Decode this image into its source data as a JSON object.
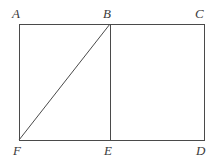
{
  "figure": {
    "type": "geometry-diagram",
    "background_color": "#ffffff",
    "stroke_color": "#4a4a4a",
    "label_color": "#3b3b3b",
    "stroke_width": 1,
    "width": 224,
    "height": 168
  },
  "labels": {
    "a": "A",
    "b": "B",
    "c": "C",
    "d": "D",
    "e": "E",
    "f": "F"
  },
  "points": {
    "A": {
      "x": 19,
      "y": 24
    },
    "B": {
      "x": 110,
      "y": 24
    },
    "C": {
      "x": 204,
      "y": 24
    },
    "D": {
      "x": 204,
      "y": 140
    },
    "E": {
      "x": 110,
      "y": 140
    },
    "F": {
      "x": 19,
      "y": 140
    }
  },
  "label_positions": {
    "A": {
      "left": 12,
      "top": 7
    },
    "B": {
      "left": 103,
      "top": 7
    },
    "C": {
      "left": 195,
      "top": 7
    },
    "D": {
      "left": 196,
      "top": 144
    },
    "E": {
      "left": 104,
      "top": 144
    },
    "F": {
      "left": 13,
      "top": 144
    }
  },
  "segments": [
    {
      "name": "side-AC-top",
      "from": "A",
      "to": "C"
    },
    {
      "name": "side-CD-right",
      "from": "C",
      "to": "D"
    },
    {
      "name": "side-FD-bottom",
      "from": "F",
      "to": "D"
    },
    {
      "name": "side-AF-left",
      "from": "A",
      "to": "F"
    },
    {
      "name": "segment-BE-vertical",
      "from": "B",
      "to": "E"
    },
    {
      "name": "segment-FB-diagonal",
      "from": "F",
      "to": "B"
    }
  ],
  "paths": {
    "rectangle_ACDF": "M 19 24 L 204 24 L 204 140 L 19 140 Z",
    "segment_BE": "M 110 24 L 110 140",
    "segment_FB": "M 19 140 L 110 24"
  }
}
